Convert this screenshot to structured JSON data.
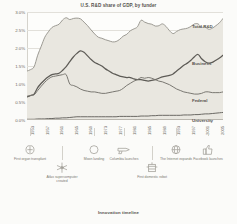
{
  "chart_data": {
    "type": "area",
    "title": "U.S. R&D share of GDP, by funder",
    "xlabel": "",
    "ylabel": "",
    "ylim": [
      0.0,
      3.0
    ],
    "ytick_labels": [
      "3.0%",
      "2.5%",
      "2.0%",
      "1.5%",
      "1.0%",
      "0.5%",
      "0.0%"
    ],
    "ytick_values": [
      3.0,
      2.5,
      2.0,
      1.5,
      1.0,
      0.5,
      0.0
    ],
    "grid": true,
    "legend_position": "right-inline",
    "x": [
      1953,
      1954,
      1955,
      1956,
      1957,
      1958,
      1959,
      1960,
      1961,
      1962,
      1963,
      1964,
      1965,
      1966,
      1967,
      1968,
      1969,
      1970,
      1971,
      1972,
      1973,
      1974,
      1975,
      1976,
      1977,
      1978,
      1979,
      1980,
      1981,
      1982,
      1983,
      1984,
      1985,
      1986,
      1987,
      1988,
      1989,
      1990,
      1991,
      1992,
      1993,
      1994,
      1995,
      1996,
      1997,
      1998,
      1999,
      2000,
      2001,
      2002,
      2003,
      2004,
      2005,
      2006,
      2007,
      2008
    ],
    "xtick_labels": [
      "1953",
      "1957",
      "1961",
      "1965",
      "1969",
      "1973",
      "1977",
      "1981",
      "1985",
      "1989",
      "1993",
      "1997",
      "2001",
      "2005"
    ],
    "series": [
      {
        "name": "Total R&D",
        "color": "#9c9a93",
        "fill": "#e9e7e0",
        "values": [
          1.36,
          1.4,
          1.48,
          1.8,
          2.05,
          2.3,
          2.45,
          2.57,
          2.62,
          2.66,
          2.78,
          2.84,
          2.79,
          2.82,
          2.83,
          2.81,
          2.72,
          2.62,
          2.5,
          2.39,
          2.3,
          2.27,
          2.23,
          2.2,
          2.17,
          2.18,
          2.24,
          2.33,
          2.38,
          2.48,
          2.53,
          2.59,
          2.77,
          2.72,
          2.68,
          2.66,
          2.61,
          2.62,
          2.67,
          2.6,
          2.48,
          2.4,
          2.46,
          2.51,
          2.53,
          2.55,
          2.6,
          2.67,
          2.67,
          2.58,
          2.58,
          2.52,
          2.55,
          2.62,
          2.7,
          2.82
        ]
      },
      {
        "name": "Business",
        "color": "#5d5b56",
        "fill": "none",
        "values": [
          0.64,
          0.68,
          0.72,
          0.9,
          1.02,
          1.12,
          1.2,
          1.26,
          1.28,
          1.3,
          1.38,
          1.48,
          1.62,
          1.75,
          1.85,
          1.92,
          1.88,
          1.78,
          1.68,
          1.6,
          1.55,
          1.5,
          1.42,
          1.36,
          1.3,
          1.26,
          1.22,
          1.2,
          1.18,
          1.18,
          1.14,
          1.12,
          1.12,
          1.1,
          1.08,
          1.1,
          1.12,
          1.16,
          1.2,
          1.22,
          1.24,
          1.28,
          1.36,
          1.44,
          1.52,
          1.58,
          1.66,
          1.76,
          1.82,
          1.7,
          1.62,
          1.58,
          1.6,
          1.66,
          1.72,
          1.8
        ]
      },
      {
        "name": "Federal",
        "color": "#7a7872",
        "fill": "none",
        "values": [
          0.66,
          0.68,
          0.7,
          0.82,
          0.94,
          1.05,
          1.14,
          1.2,
          1.22,
          1.24,
          1.26,
          1.26,
          1.0,
          0.96,
          0.92,
          0.86,
          0.82,
          0.8,
          0.78,
          0.78,
          0.76,
          0.74,
          0.74,
          0.76,
          0.78,
          0.8,
          0.82,
          0.88,
          0.96,
          1.02,
          1.08,
          1.12,
          1.18,
          1.16,
          1.18,
          1.16,
          1.12,
          1.08,
          1.06,
          1.02,
          0.98,
          0.92,
          0.86,
          0.82,
          0.78,
          0.76,
          0.74,
          0.72,
          0.72,
          0.74,
          0.78,
          0.78,
          0.76,
          0.76,
          0.76,
          0.78
        ]
      },
      {
        "name": "University",
        "color": "#6b6964",
        "fill": "none",
        "values": [
          0.02,
          0.02,
          0.02,
          0.03,
          0.03,
          0.03,
          0.04,
          0.04,
          0.05,
          0.05,
          0.06,
          0.06,
          0.07,
          0.08,
          0.09,
          0.09,
          0.09,
          0.09,
          0.09,
          0.09,
          0.09,
          0.09,
          0.09,
          0.09,
          0.09,
          0.09,
          0.1,
          0.1,
          0.1,
          0.1,
          0.1,
          0.1,
          0.11,
          0.11,
          0.11,
          0.12,
          0.12,
          0.13,
          0.13,
          0.13,
          0.13,
          0.13,
          0.13,
          0.13,
          0.14,
          0.14,
          0.14,
          0.15,
          0.15,
          0.16,
          0.17,
          0.17,
          0.18,
          0.19,
          0.2,
          0.21
        ]
      }
    ]
  },
  "timeline": {
    "title": "Innovation timeline",
    "events": [
      {
        "label": "First organ transplant",
        "icon": "kidney-icon"
      },
      {
        "label": "Atlas supercomputer created",
        "icon": "supercomputer-icon"
      },
      {
        "label": "Moon landing",
        "icon": "moon-icon"
      },
      {
        "label": "Columbia launches",
        "icon": "shuttle-icon"
      },
      {
        "label": "First domestic robot",
        "icon": "robot-icon"
      },
      {
        "label": "The Internet expands",
        "icon": "globe-icon"
      },
      {
        "label": "Facebook launches",
        "icon": "thumbs-up-icon"
      }
    ]
  }
}
